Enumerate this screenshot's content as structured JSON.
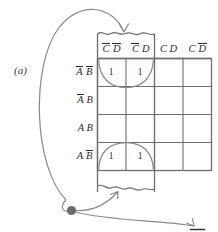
{
  "figure": {
    "label": "(a)",
    "type": "karnaugh-map"
  },
  "map": {
    "column_headers": [
      {
        "id": "col-0",
        "text": "C̅D̅",
        "c": "C",
        "c_bar": true,
        "d": "D",
        "d_bar": true
      },
      {
        "id": "col-1",
        "text": "C̅D",
        "c": "C",
        "c_bar": true,
        "d": "D",
        "d_bar": false
      },
      {
        "id": "col-2",
        "text": "CD",
        "c": "C",
        "c_bar": false,
        "d": "D",
        "d_bar": false
      },
      {
        "id": "col-3",
        "text": "CD̅",
        "c": "C",
        "c_bar": false,
        "d": "D",
        "d_bar": true
      }
    ],
    "row_headers": [
      {
        "id": "row-0",
        "text": "A̅B̅",
        "a": "A",
        "a_bar": true,
        "b": "B",
        "b_bar": true
      },
      {
        "id": "row-1",
        "text": "A̅B",
        "a": "A",
        "a_bar": true,
        "b": "B",
        "b_bar": false
      },
      {
        "id": "row-2",
        "text": "AB",
        "a": "A",
        "a_bar": false,
        "b": "B",
        "b_bar": false
      },
      {
        "id": "row-3",
        "text": "AB̅",
        "a": "A",
        "a_bar": false,
        "b": "B",
        "b_bar": true
      }
    ],
    "cells": [
      [
        "1",
        "1",
        "",
        ""
      ],
      [
        "",
        "",
        "",
        ""
      ],
      [
        "",
        "",
        "",
        ""
      ],
      [
        "1",
        "1",
        "",
        ""
      ]
    ]
  },
  "annotations": {
    "strip_note": "torn-paper strip over columns C̅D̅ and C̅D",
    "loop_top_note": "grouping loop around top-row ones",
    "loop_bottom_note": "grouping loop around bottom-row ones",
    "junction_note": "solid connector dot",
    "trailing_bar_note": "overbar fragment at lower right edge"
  },
  "colors": {
    "ink": "#2b2b2b",
    "grid": "#6e6e6e",
    "curve": "#8a8a8a",
    "dot": "#6b6b6b",
    "background": "#ffffff"
  }
}
